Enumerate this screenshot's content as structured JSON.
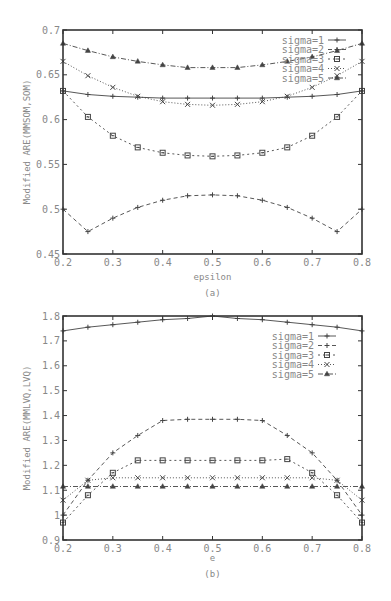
{
  "chart_data": [
    {
      "type": "line",
      "panel": "(a)",
      "title": "",
      "xlabel": "epsilon",
      "ylabel": "Modified ARE(MMSOM,SOM)",
      "caption": "(a)",
      "xlim": [
        0.2,
        0.8
      ],
      "ylim": [
        0.45,
        0.7
      ],
      "xticks": [
        0.2,
        0.3,
        0.4,
        0.5,
        0.6,
        0.7,
        0.8
      ],
      "yticks": [
        0.45,
        0.5,
        0.55,
        0.6,
        0.65,
        0.7
      ],
      "grid": false,
      "legend_position": "top-right",
      "x": [
        0.2,
        0.25,
        0.3,
        0.35,
        0.4,
        0.45,
        0.5,
        0.55,
        0.6,
        0.65,
        0.7,
        0.75,
        0.8
      ],
      "series": [
        {
          "name": "sigma=1",
          "style": "solid",
          "marker": "plus",
          "values": [
            0.632,
            0.628,
            0.626,
            0.625,
            0.624,
            0.624,
            0.624,
            0.624,
            0.624,
            0.625,
            0.626,
            0.628,
            0.632
          ]
        },
        {
          "name": "sigma=2",
          "style": "dashed",
          "marker": "plus",
          "values": [
            0.5,
            0.475,
            0.49,
            0.502,
            0.51,
            0.515,
            0.516,
            0.515,
            0.51,
            0.502,
            0.49,
            0.475,
            0.5
          ]
        },
        {
          "name": "sigma=3",
          "style": "dotted",
          "marker": "square",
          "values": [
            0.632,
            0.603,
            0.582,
            0.569,
            0.563,
            0.56,
            0.559,
            0.56,
            0.563,
            0.569,
            0.582,
            0.603,
            0.632
          ]
        },
        {
          "name": "sigma=4",
          "style": "dotted-fine",
          "marker": "cross",
          "values": [
            0.665,
            0.649,
            0.636,
            0.626,
            0.62,
            0.617,
            0.616,
            0.617,
            0.62,
            0.626,
            0.636,
            0.649,
            0.665
          ]
        },
        {
          "name": "sigma=5",
          "style": "dashdot",
          "marker": "triangle",
          "values": [
            0.685,
            0.677,
            0.67,
            0.665,
            0.661,
            0.658,
            0.658,
            0.658,
            0.661,
            0.665,
            0.67,
            0.677,
            0.685
          ]
        }
      ]
    },
    {
      "type": "line",
      "panel": "(b)",
      "title": "",
      "xlabel": "e",
      "ylabel": "Modified ARE(MMLVQ,LVQ)",
      "caption": "(b)",
      "xlim": [
        0.2,
        0.8
      ],
      "ylim": [
        0.9,
        1.8
      ],
      "xticks": [
        0.2,
        0.3,
        0.4,
        0.5,
        0.6,
        0.7,
        0.8
      ],
      "yticks": [
        0.9,
        1,
        1.1,
        1.2,
        1.3,
        1.4,
        1.5,
        1.6,
        1.7,
        1.8
      ],
      "grid": false,
      "legend_position": "top-right",
      "x": [
        0.2,
        0.25,
        0.3,
        0.35,
        0.4,
        0.45,
        0.5,
        0.55,
        0.6,
        0.65,
        0.7,
        0.75,
        0.8
      ],
      "series": [
        {
          "name": "sigma=1",
          "style": "solid",
          "marker": "plus",
          "values": [
            1.74,
            1.755,
            1.765,
            1.775,
            1.785,
            1.79,
            1.8,
            1.79,
            1.785,
            1.775,
            1.765,
            1.755,
            1.74
          ]
        },
        {
          "name": "sigma=2",
          "style": "dashed",
          "marker": "plus",
          "values": [
            1.0,
            1.14,
            1.25,
            1.32,
            1.38,
            1.385,
            1.385,
            1.385,
            1.38,
            1.32,
            1.25,
            1.14,
            1.0
          ]
        },
        {
          "name": "sigma=3",
          "style": "dotted",
          "marker": "square",
          "values": [
            0.97,
            1.08,
            1.17,
            1.22,
            1.22,
            1.22,
            1.22,
            1.22,
            1.22,
            1.225,
            1.17,
            1.08,
            0.97
          ]
        },
        {
          "name": "sigma=4",
          "style": "dotted-fine",
          "marker": "cross",
          "values": [
            1.06,
            1.14,
            1.15,
            1.15,
            1.15,
            1.15,
            1.15,
            1.15,
            1.15,
            1.15,
            1.15,
            1.14,
            1.06
          ]
        },
        {
          "name": "sigma=5",
          "style": "dashdot",
          "marker": "triangle",
          "values": [
            1.115,
            1.115,
            1.115,
            1.115,
            1.115,
            1.115,
            1.115,
            1.115,
            1.115,
            1.115,
            1.115,
            1.115,
            1.115
          ]
        }
      ]
    }
  ],
  "colors": {
    "axis": "#333333",
    "line": "#444444",
    "text": "#888888",
    "background": "#ffffff"
  }
}
